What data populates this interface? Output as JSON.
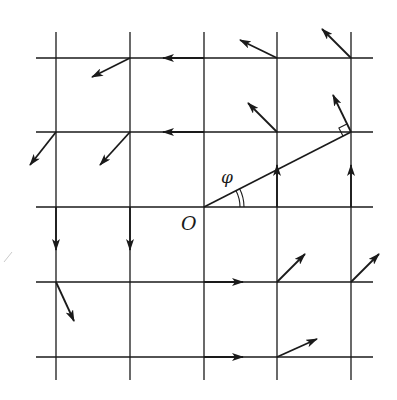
{
  "diagram": {
    "labels": {
      "origin": "O",
      "angle": "φ"
    },
    "colors": {
      "ink": "#1a1a1a",
      "background": "#ffffff"
    },
    "grid": {
      "x_lines": [
        56,
        130,
        204,
        277,
        351
      ],
      "y_lines": [
        58,
        132,
        207,
        282,
        357
      ],
      "extent": {
        "x_min": 36,
        "x_max": 373,
        "y_min": 32,
        "y_max": 380
      }
    },
    "origin": {
      "x": 204,
      "y": 207
    },
    "radius_line": {
      "from": [
        204,
        207
      ],
      "to": [
        351,
        132
      ]
    },
    "arrows": [
      {
        "from": [
          130,
          58
        ],
        "to": [
          92,
          77
        ]
      },
      {
        "from": [
          204,
          58
        ],
        "to": [
          163,
          58
        ]
      },
      {
        "from": [
          277,
          58
        ],
        "to": [
          240,
          40
        ]
      },
      {
        "from": [
          351,
          58
        ],
        "to": [
          322,
          29
        ]
      },
      {
        "from": [
          56,
          132
        ],
        "to": [
          30,
          165
        ]
      },
      {
        "from": [
          130,
          132
        ],
        "to": [
          100,
          165
        ]
      },
      {
        "from": [
          204,
          132
        ],
        "to": [
          163,
          132
        ]
      },
      {
        "from": [
          277,
          132
        ],
        "to": [
          248,
          103
        ]
      },
      {
        "from": [
          351,
          132
        ],
        "to": [
          333,
          95
        ]
      },
      {
        "from": [
          56,
          207
        ],
        "to": [
          56,
          250
        ]
      },
      {
        "from": [
          130,
          207
        ],
        "to": [
          130,
          250
        ]
      },
      {
        "from": [
          277,
          207
        ],
        "to": [
          277,
          165
        ]
      },
      {
        "from": [
          351,
          207
        ],
        "to": [
          351,
          165
        ]
      },
      {
        "from": [
          56,
          282
        ],
        "to": [
          74,
          321
        ]
      },
      {
        "from": [
          204,
          282
        ],
        "to": [
          243,
          282
        ]
      },
      {
        "from": [
          277,
          282
        ],
        "to": [
          305,
          254
        ]
      },
      {
        "from": [
          351,
          282
        ],
        "to": [
          379,
          254
        ]
      },
      {
        "from": [
          204,
          357
        ],
        "to": [
          243,
          357
        ]
      },
      {
        "from": [
          277,
          357
        ],
        "to": [
          317,
          339
        ]
      }
    ]
  }
}
